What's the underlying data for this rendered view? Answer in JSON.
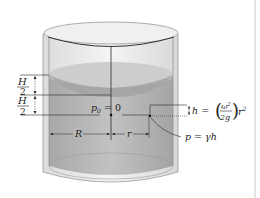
{
  "figure": {
    "type": "rotating-cylinder-paraboloid",
    "labels": {
      "h_half_top_num": "H",
      "h_half_top_den": "2",
      "h_half_bot_num": "H",
      "h_half_bot_den": "2",
      "p0": "p",
      "p0_sub": "0",
      "p0_eq": " = 0",
      "R": "R",
      "r": "r",
      "h_eq_lhs": "h = ",
      "omega": "ω",
      "omega_sup": "2",
      "two_g": "2g",
      "r2": "r",
      "r2_sup": "2",
      "p_eq": "p = γh"
    },
    "colors": {
      "water": "#b4b4b4",
      "water_dark": "#9c9c9c",
      "surface": "#cfcfcf",
      "glass": "#e6e6e6",
      "line": "#2a2a2a",
      "divider": "#c8c8c8"
    }
  }
}
